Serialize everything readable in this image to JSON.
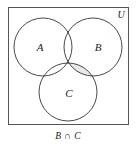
{
  "figure": {
    "universe_label": "U",
    "caption": "B ∩ C",
    "shaded_region": "B ∩ C",
    "border_color": "#555555",
    "circle_stroke_color": "#333333",
    "shade_color": "#e8e8e8",
    "background_color": "#ffffff"
  },
  "sets": [
    {
      "id": "A",
      "label": "A",
      "cx": 43,
      "cy": 47,
      "r": 29
    },
    {
      "id": "B",
      "label": "B",
      "cx": 93,
      "cy": 47,
      "r": 29
    },
    {
      "id": "C",
      "label": "C",
      "cx": 68,
      "cy": 92,
      "r": 29
    }
  ],
  "labels": {
    "a": "A",
    "b": "B",
    "c": "C"
  },
  "box": {
    "x": 8,
    "y": 7,
    "width": 121,
    "height": 118
  }
}
